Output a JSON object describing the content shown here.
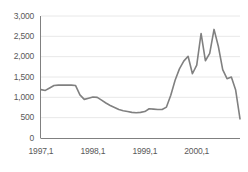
{
  "chart_data": {
    "type": "line",
    "title": "",
    "subtitle": "",
    "xlabel": "",
    "ylabel": "",
    "grid": true,
    "legend": null,
    "legend_position": "none",
    "line_color": "#808080",
    "axis_color": "#808080",
    "grid_color": "#e8e8e8",
    "text_color": "#595959",
    "ylim": [
      0,
      3000
    ],
    "ytick_values": [
      0,
      500,
      1000,
      1500,
      2000,
      2500,
      3000
    ],
    "ytick_labels": [
      "0",
      "500",
      "1,000",
      "1,500",
      "2,000",
      "2,500",
      "3,000"
    ],
    "xtick_labels": [
      "1997,1",
      "1998,1",
      "1999,1",
      "2000,1"
    ],
    "xtick_index": [
      0,
      12,
      24,
      36
    ],
    "x": [
      "1997,1",
      "1997,2",
      "1997,3",
      "1997,4",
      "1997,5",
      "1997,6",
      "1997,7",
      "1997,8",
      "1997,9",
      "1997,10",
      "1997,11",
      "1997,12",
      "1998,1",
      "1998,2",
      "1998,3",
      "1998,4",
      "1998,5",
      "1998,6",
      "1998,7",
      "1998,8",
      "1998,9",
      "1998,10",
      "1998,11",
      "1998,12",
      "1999,1",
      "1999,2",
      "1999,3",
      "1999,4",
      "1999,5",
      "1999,6",
      "1999,7",
      "1999,8",
      "1999,9",
      "1999,10",
      "1999,11",
      "1999,12",
      "2000,1",
      "2000,2",
      "2000,3",
      "2000,4",
      "2000,5",
      "2000,6",
      "2000,7",
      "2000,8",
      "2000,9",
      "2000,10",
      "2000,11"
    ],
    "values": [
      1190,
      1170,
      1230,
      1290,
      1300,
      1300,
      1300,
      1300,
      1290,
      1060,
      950,
      980,
      1010,
      1000,
      930,
      860,
      800,
      750,
      700,
      670,
      650,
      630,
      620,
      630,
      650,
      720,
      710,
      700,
      700,
      760,
      1050,
      1420,
      1700,
      1890,
      2010,
      1580,
      1790,
      2570,
      1900,
      2080,
      2670,
      2250,
      1680,
      1460,
      1500,
      1180,
      470
    ]
  }
}
